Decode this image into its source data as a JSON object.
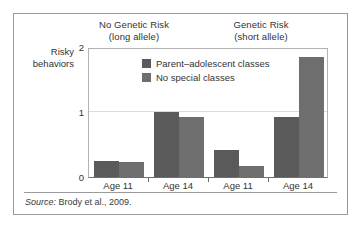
{
  "figure": {
    "source_lead": "Source:",
    "source_text": " Brody et al., 2009."
  },
  "chart_data": {
    "type": "bar",
    "title": "",
    "xlabel": "",
    "ylabel": "Risky behaviors",
    "ylabel_line1": "Risky",
    "ylabel_line2": "behaviors",
    "ylim": [
      0,
      2
    ],
    "yticks": [
      "0",
      "1",
      "2"
    ],
    "ytick_values": [
      0,
      1,
      2
    ],
    "gridlines": [
      "1"
    ],
    "grid": true,
    "legend_position": "inside-top-center",
    "panels": [
      {
        "line1": "No Genetic Risk",
        "line2": "(long allele)"
      },
      {
        "line1": "Genetic Risk",
        "line2": "(short allele)"
      }
    ],
    "categories": [
      "Age 11",
      "Age 14",
      "Age 11",
      "Age 14"
    ],
    "series": [
      {
        "name": "Parent–adolescent classes",
        "color": "#5a5a5a",
        "values": [
          0.25,
          1.0,
          0.42,
          0.92
        ]
      },
      {
        "name": "No special classes",
        "color": "#6e6e6e",
        "values": [
          0.23,
          0.92,
          0.17,
          1.85
        ]
      }
    ]
  }
}
